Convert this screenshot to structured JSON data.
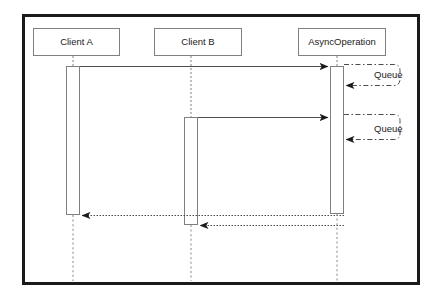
{
  "diagram": {
    "type": "uml-sequence-diagram",
    "frame": {
      "x": 22,
      "y": 14,
      "width": 398,
      "height": 271,
      "border_color": "#1a1a1a",
      "border_width": 3,
      "background": "#ffffff"
    },
    "line_color": "#4d4d4d",
    "text_color": "#1a1a1a",
    "lifelines": [
      {
        "id": "client-a",
        "label": "Client A",
        "box": {
          "x": 33,
          "y": 28,
          "width": 87,
          "height": 28
        },
        "axis_x": 73
      },
      {
        "id": "client-b",
        "label": "Client B",
        "box": {
          "x": 154,
          "y": 28,
          "width": 88,
          "height": 28
        },
        "axis_x": 191
      },
      {
        "id": "async-operation",
        "label": "AsyncOperation",
        "box": {
          "x": 298,
          "y": 28,
          "width": 88,
          "height": 28
        },
        "axis_x": 337
      }
    ],
    "activations": [
      {
        "id": "activation-client-a",
        "lifeline": "client-a",
        "x": 66,
        "y": 66,
        "width": 14,
        "height": 149
      },
      {
        "id": "activation-client-b",
        "lifeline": "client-b",
        "x": 184,
        "y": 117,
        "width": 14,
        "height": 108
      },
      {
        "id": "activation-async-operation",
        "lifeline": "async-operation",
        "x": 330,
        "y": 66,
        "width": 14,
        "height": 148
      }
    ],
    "messages": [
      {
        "id": "call-client-a-to-async",
        "from": "client-a",
        "to": "async-operation",
        "style": "solid",
        "direction": "right",
        "label": "",
        "x1": 80,
        "x2": 330,
        "y": 66
      },
      {
        "id": "call-client-b-to-async",
        "from": "client-b",
        "to": "async-operation",
        "style": "solid",
        "direction": "right",
        "label": "",
        "x1": 198,
        "x2": 330,
        "y": 117
      },
      {
        "id": "return-async-to-client-a",
        "from": "async-operation",
        "to": "client-a",
        "style": "dotted",
        "direction": "left",
        "label": "",
        "x1": 344,
        "x2": 80,
        "y": 215
      },
      {
        "id": "return-async-to-client-b",
        "from": "async-operation",
        "to": "client-b",
        "style": "dotted",
        "direction": "left",
        "label": "",
        "x1": 344,
        "x2": 198,
        "y": 225
      }
    ],
    "self_messages": [
      {
        "id": "queue-message-1",
        "lifeline": "async-operation",
        "label": "Queue",
        "style": "dash-dot",
        "start_y": 64,
        "end_y": 85,
        "extent_x": 400,
        "label_x": 374,
        "label_y": 74
      },
      {
        "id": "queue-message-2",
        "lifeline": "async-operation",
        "label": "Queue",
        "style": "dash-dot",
        "start_y": 114,
        "end_y": 139,
        "extent_x": 400,
        "label_x": 374,
        "label_y": 128
      }
    ],
    "lifeline_tails": [
      {
        "lifeline": "client-a",
        "x": 73,
        "y1": 215,
        "y2": 281
      },
      {
        "lifeline": "client-b",
        "x": 191,
        "y1": 225,
        "y2": 281
      },
      {
        "lifeline": "async-operation",
        "x": 337,
        "y1": 214,
        "y2": 281
      }
    ],
    "lifeline_heads": [
      {
        "lifeline": "client-a",
        "x": 73,
        "y1": 56,
        "y2": 66
      },
      {
        "lifeline": "client-b",
        "x": 191,
        "y1": 56,
        "y2": 117
      },
      {
        "lifeline": "async-operation",
        "x": 337,
        "y1": 56,
        "y2": 66
      }
    ]
  }
}
